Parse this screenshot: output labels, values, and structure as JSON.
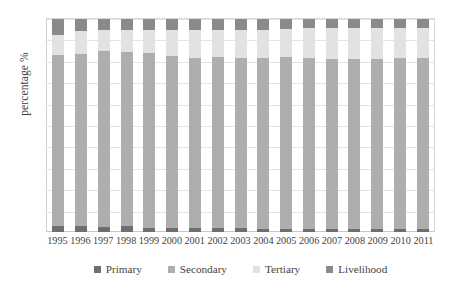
{
  "chart_data": {
    "type": "bar",
    "subtype": "stacked-bar-100",
    "title": "",
    "xlabel": "",
    "ylabel": "percentage %",
    "ylim": [
      0,
      100
    ],
    "ytick_step": 10,
    "yticks": [
      100,
      90,
      80,
      70,
      60,
      50,
      40,
      30,
      20,
      10,
      0
    ],
    "grid": true,
    "legend_position": "bottom",
    "categories": [
      "1995",
      "1996",
      "1997",
      "1998",
      "1999",
      "2000",
      "2001",
      "2002",
      "2003",
      "2004",
      "2005",
      "2006",
      "2007",
      "2008",
      "2009",
      "2010",
      "2011"
    ],
    "series": [
      {
        "name": "Primary",
        "color": "#6e6e6e",
        "values": [
          3.0,
          2.8,
          2.4,
          2.6,
          2.0,
          2.0,
          2.0,
          1.8,
          1.8,
          1.6,
          1.6,
          1.6,
          1.5,
          1.5,
          1.4,
          1.4,
          1.3
        ]
      },
      {
        "name": "Secondary",
        "color": "#aeaeae",
        "values": [
          80.0,
          81.0,
          82.6,
          81.9,
          82.0,
          80.5,
          79.8,
          80.2,
          80.0,
          80.2,
          80.5,
          80.0,
          79.8,
          79.9,
          80.0,
          80.1,
          80.2
        ]
      },
      {
        "name": "Tertiary",
        "color": "#e2e2e2",
        "values": [
          9.5,
          10.7,
          10.0,
          10.5,
          11.0,
          12.5,
          13.2,
          13.0,
          13.2,
          13.2,
          13.4,
          14.4,
          14.7,
          14.6,
          14.6,
          14.5,
          14.5
        ]
      },
      {
        "name": "Livelihood",
        "color": "#8a8a8a",
        "values": [
          7.5,
          5.5,
          5.0,
          5.0,
          5.0,
          5.0,
          5.0,
          5.0,
          5.0,
          5.0,
          4.5,
          4.0,
          4.0,
          4.0,
          4.0,
          4.0,
          4.0
        ]
      }
    ]
  },
  "axis": {
    "ylabel": "percentage %"
  }
}
